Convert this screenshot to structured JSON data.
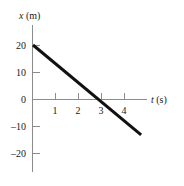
{
  "chart_data": {
    "type": "line",
    "title": "",
    "xlabel": "t (s)",
    "ylabel": "x (m)",
    "xlabel_symbol": "t",
    "xlabel_unit": "(s)",
    "ylabel_symbol": "x",
    "ylabel_unit": "(m)",
    "xlim": [
      0,
      5
    ],
    "ylim": [
      -25,
      25
    ],
    "xticks": [
      1,
      2,
      3,
      4
    ],
    "xtick_labels": [
      "1",
      "2",
      "3",
      "4"
    ],
    "yticks": [
      20,
      10,
      0,
      -10,
      -20
    ],
    "ytick_labels": [
      "20",
      "10",
      "0",
      "–10",
      "–20"
    ],
    "grid": false,
    "legend": false,
    "series": [
      {
        "name": "position",
        "x": [
          0,
          4.7
        ],
        "y": [
          20,
          -13.3
        ],
        "intercept": 20,
        "slope": -6.67,
        "zero_crossing_t": 3,
        "color": "#111111",
        "linewidth": 3
      }
    ],
    "annotations": []
  },
  "colors": {
    "axis": "#8c8c8c",
    "curve": "#111111",
    "text": "#1a1a1a",
    "background": "#ffffff"
  }
}
